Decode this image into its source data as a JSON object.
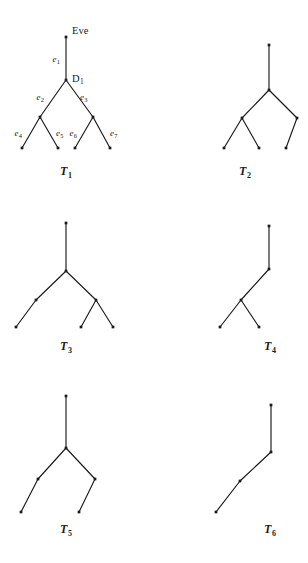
{
  "figure": {
    "background_color": "#ffffff",
    "ink_color": "#1a1a1a"
  },
  "trees": [
    {
      "id": "T1",
      "caption": "T",
      "caption_sub": "1",
      "caption_x": 66,
      "caption_y": 175,
      "nodes": [
        {
          "name": "root",
          "x": 66,
          "y": 37
        },
        {
          "name": "d1",
          "x": 66,
          "y": 80
        },
        {
          "name": "left-internal",
          "x": 40,
          "y": 117
        },
        {
          "name": "right-internal",
          "x": 93,
          "y": 117
        },
        {
          "name": "leaf-1",
          "x": 22,
          "y": 148
        },
        {
          "name": "leaf-2",
          "x": 58,
          "y": 148
        },
        {
          "name": "leaf-3",
          "x": 75,
          "y": 148
        },
        {
          "name": "leaf-4",
          "x": 110,
          "y": 148
        }
      ],
      "edges": [
        {
          "from": "root",
          "to": "d1"
        },
        {
          "from": "d1",
          "to": "left-internal"
        },
        {
          "from": "d1",
          "to": "right-internal"
        },
        {
          "from": "left-internal",
          "to": "leaf-1"
        },
        {
          "from": "left-internal",
          "to": "leaf-2"
        },
        {
          "from": "right-internal",
          "to": "leaf-3"
        },
        {
          "from": "right-internal",
          "to": "leaf-4"
        }
      ],
      "node_labels": [
        {
          "text": "Eve",
          "sub": "",
          "x": 72,
          "y": 34,
          "anchor": "start"
        },
        {
          "text": "D",
          "sub": "1",
          "x": 72,
          "y": 82,
          "anchor": "start"
        }
      ],
      "edge_labels": [
        {
          "text": "e",
          "sub": "1",
          "x": 60,
          "y": 62,
          "anchor": "end"
        },
        {
          "text": "e",
          "sub": "2",
          "x": 44,
          "y": 100,
          "anchor": "end"
        },
        {
          "text": "e",
          "sub": "3",
          "x": 80,
          "y": 100,
          "anchor": "start"
        },
        {
          "text": "e",
          "sub": "4",
          "x": 22,
          "y": 136,
          "anchor": "end"
        },
        {
          "text": "e",
          "sub": "5",
          "x": 56,
          "y": 136,
          "anchor": "start"
        },
        {
          "text": "e",
          "sub": "6",
          "x": 77,
          "y": 136,
          "anchor": "end"
        },
        {
          "text": "e",
          "sub": "7",
          "x": 110,
          "y": 136,
          "anchor": "start"
        }
      ]
    },
    {
      "id": "T2",
      "caption": "T",
      "caption_sub": "2",
      "caption_x": 245,
      "caption_y": 175,
      "nodes": [
        {
          "name": "root",
          "x": 269,
          "y": 45
        },
        {
          "name": "split",
          "x": 269,
          "y": 90
        },
        {
          "name": "left-internal",
          "x": 242,
          "y": 118
        },
        {
          "name": "right-leaf",
          "x": 297,
          "y": 118
        },
        {
          "name": "leaf-1",
          "x": 224,
          "y": 148
        },
        {
          "name": "leaf-2",
          "x": 259,
          "y": 148
        },
        {
          "name": "leaf-3",
          "x": 286,
          "y": 148
        }
      ],
      "edges": [
        {
          "from": "root",
          "to": "split"
        },
        {
          "from": "split",
          "to": "left-internal"
        },
        {
          "from": "split",
          "to": "right-leaf"
        },
        {
          "from": "left-internal",
          "to": "leaf-1"
        },
        {
          "from": "left-internal",
          "to": "leaf-2"
        },
        {
          "from": "right-leaf",
          "to": "leaf-3"
        }
      ],
      "node_labels": [],
      "edge_labels": []
    },
    {
      "id": "T3",
      "caption": "T",
      "caption_sub": "3",
      "caption_x": 66,
      "caption_y": 350,
      "nodes": [
        {
          "name": "root",
          "x": 66,
          "y": 223
        },
        {
          "name": "split",
          "x": 66,
          "y": 271
        },
        {
          "name": "left-leaf",
          "x": 36,
          "y": 300
        },
        {
          "name": "right-internal",
          "x": 96,
          "y": 300
        },
        {
          "name": "leaf-1",
          "x": 16,
          "y": 327
        },
        {
          "name": "leaf-2",
          "x": 81,
          "y": 327
        },
        {
          "name": "leaf-3",
          "x": 113,
          "y": 327
        }
      ],
      "edges": [
        {
          "from": "root",
          "to": "split"
        },
        {
          "from": "split",
          "to": "left-leaf"
        },
        {
          "from": "split",
          "to": "right-internal"
        },
        {
          "from": "left-leaf",
          "to": "leaf-1"
        },
        {
          "from": "right-internal",
          "to": "leaf-2"
        },
        {
          "from": "right-internal",
          "to": "leaf-3"
        }
      ],
      "node_labels": [],
      "edge_labels": []
    },
    {
      "id": "T4",
      "caption": "T",
      "caption_sub": "4",
      "caption_x": 270,
      "caption_y": 350,
      "nodes": [
        {
          "name": "root",
          "x": 269,
          "y": 226
        },
        {
          "name": "mid",
          "x": 269,
          "y": 269
        },
        {
          "name": "split",
          "x": 241,
          "y": 300
        },
        {
          "name": "leaf-1",
          "x": 220,
          "y": 327
        },
        {
          "name": "leaf-2",
          "x": 259,
          "y": 327
        }
      ],
      "edges": [
        {
          "from": "root",
          "to": "mid"
        },
        {
          "from": "mid",
          "to": "split"
        },
        {
          "from": "split",
          "to": "leaf-1"
        },
        {
          "from": "split",
          "to": "leaf-2"
        }
      ],
      "node_labels": [],
      "edge_labels": []
    },
    {
      "id": "T5",
      "caption": "T",
      "caption_sub": "5",
      "caption_x": 66,
      "caption_y": 533,
      "nodes": [
        {
          "name": "root",
          "x": 66,
          "y": 396
        },
        {
          "name": "split",
          "x": 66,
          "y": 448
        },
        {
          "name": "left-mid",
          "x": 38,
          "y": 479
        },
        {
          "name": "right-mid",
          "x": 95,
          "y": 479
        },
        {
          "name": "leaf-1",
          "x": 21,
          "y": 512
        },
        {
          "name": "leaf-2",
          "x": 79,
          "y": 512
        }
      ],
      "edges": [
        {
          "from": "root",
          "to": "split"
        },
        {
          "from": "split",
          "to": "left-mid"
        },
        {
          "from": "split",
          "to": "right-mid"
        },
        {
          "from": "left-mid",
          "to": "leaf-1"
        },
        {
          "from": "right-mid",
          "to": "leaf-2"
        }
      ],
      "node_labels": [],
      "edge_labels": []
    },
    {
      "id": "T6",
      "caption": "T",
      "caption_sub": "6",
      "caption_x": 270,
      "caption_y": 533,
      "nodes": [
        {
          "name": "root",
          "x": 271,
          "y": 405
        },
        {
          "name": "mid-1",
          "x": 271,
          "y": 452
        },
        {
          "name": "mid-2",
          "x": 240,
          "y": 481
        },
        {
          "name": "leaf-1",
          "x": 216,
          "y": 512
        }
      ],
      "edges": [
        {
          "from": "root",
          "to": "mid-1"
        },
        {
          "from": "mid-1",
          "to": "mid-2"
        },
        {
          "from": "mid-2",
          "to": "leaf-1"
        }
      ],
      "node_labels": [],
      "edge_labels": []
    }
  ]
}
